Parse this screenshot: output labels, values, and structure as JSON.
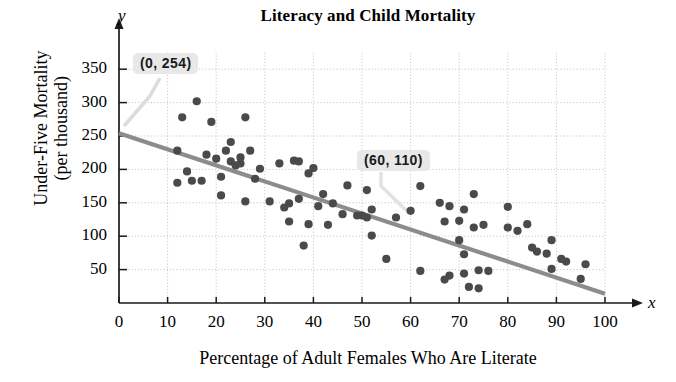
{
  "chart_data": {
    "type": "scatter",
    "title": "Literacy and Child Mortality",
    "xlabel": "Percentage of Adult Females Who Are Literate",
    "ylabel": "Under-Five Mortality (per thousand)",
    "ylabel_line1": "Under-Five Mortality",
    "ylabel_line2": "(per thousand)",
    "xlim": [
      0,
      100
    ],
    "ylim": [
      0,
      375
    ],
    "xticks": [
      0,
      10,
      20,
      30,
      40,
      50,
      60,
      70,
      80,
      90,
      100
    ],
    "yticks": [
      50,
      100,
      150,
      200,
      250,
      300,
      350
    ],
    "xtick_labels": [
      "0",
      "10",
      "20",
      "30",
      "40",
      "50",
      "60",
      "70",
      "80",
      "90",
      "100"
    ],
    "ytick_labels": [
      "50",
      "100",
      "150",
      "200",
      "250",
      "300",
      "350"
    ],
    "x_axis_variable": "x",
    "y_axis_variable": "y",
    "grid": true,
    "grid_style": "dotted",
    "legend": "none",
    "point_color": "#4a4a4a",
    "line_color": "#8c8c8c",
    "trend_line": {
      "label": "line of best fit",
      "point1": {
        "x": 0,
        "y": 254,
        "label": "(0, 254)"
      },
      "point2": {
        "x": 60,
        "y": 110,
        "label": "(60, 110)"
      },
      "slope": -2.4,
      "intercept": 254
    },
    "annotations": [
      {
        "text": "(0, 254)",
        "target_x": 0,
        "target_y": 254
      },
      {
        "text": "(60, 110)",
        "target_x": 60,
        "target_y": 110
      }
    ],
    "points": [
      {
        "x": 12,
        "y": 228
      },
      {
        "x": 12,
        "y": 180
      },
      {
        "x": 13,
        "y": 278
      },
      {
        "x": 14,
        "y": 197
      },
      {
        "x": 15,
        "y": 183
      },
      {
        "x": 16,
        "y": 302
      },
      {
        "x": 17,
        "y": 183
      },
      {
        "x": 18,
        "y": 222
      },
      {
        "x": 19,
        "y": 271
      },
      {
        "x": 20,
        "y": 216
      },
      {
        "x": 21,
        "y": 161
      },
      {
        "x": 21,
        "y": 189
      },
      {
        "x": 22,
        "y": 228
      },
      {
        "x": 23,
        "y": 241
      },
      {
        "x": 23,
        "y": 212
      },
      {
        "x": 24,
        "y": 206
      },
      {
        "x": 25,
        "y": 218
      },
      {
        "x": 25,
        "y": 209
      },
      {
        "x": 26,
        "y": 278
      },
      {
        "x": 26,
        "y": 152
      },
      {
        "x": 27,
        "y": 228
      },
      {
        "x": 28,
        "y": 186
      },
      {
        "x": 29,
        "y": 201
      },
      {
        "x": 31,
        "y": 152
      },
      {
        "x": 33,
        "y": 209
      },
      {
        "x": 34,
        "y": 143
      },
      {
        "x": 35,
        "y": 149
      },
      {
        "x": 35,
        "y": 122
      },
      {
        "x": 36,
        "y": 213
      },
      {
        "x": 37,
        "y": 212
      },
      {
        "x": 37,
        "y": 156
      },
      {
        "x": 38,
        "y": 86
      },
      {
        "x": 39,
        "y": 118
      },
      {
        "x": 39,
        "y": 194
      },
      {
        "x": 40,
        "y": 202
      },
      {
        "x": 41,
        "y": 145
      },
      {
        "x": 42,
        "y": 163
      },
      {
        "x": 43,
        "y": 117
      },
      {
        "x": 44,
        "y": 149
      },
      {
        "x": 46,
        "y": 133
      },
      {
        "x": 47,
        "y": 176
      },
      {
        "x": 49,
        "y": 131
      },
      {
        "x": 50,
        "y": 131
      },
      {
        "x": 51,
        "y": 128
      },
      {
        "x": 51,
        "y": 169
      },
      {
        "x": 52,
        "y": 140
      },
      {
        "x": 52,
        "y": 101
      },
      {
        "x": 55,
        "y": 66
      },
      {
        "x": 57,
        "y": 128
      },
      {
        "x": 60,
        "y": 138
      },
      {
        "x": 62,
        "y": 175
      },
      {
        "x": 62,
        "y": 48
      },
      {
        "x": 66,
        "y": 150
      },
      {
        "x": 67,
        "y": 122
      },
      {
        "x": 67,
        "y": 35
      },
      {
        "x": 68,
        "y": 41
      },
      {
        "x": 68,
        "y": 145
      },
      {
        "x": 70,
        "y": 123
      },
      {
        "x": 70,
        "y": 94
      },
      {
        "x": 71,
        "y": 140
      },
      {
        "x": 71,
        "y": 73
      },
      {
        "x": 71,
        "y": 44
      },
      {
        "x": 72,
        "y": 24
      },
      {
        "x": 73,
        "y": 163
      },
      {
        "x": 73,
        "y": 113
      },
      {
        "x": 74,
        "y": 49
      },
      {
        "x": 74,
        "y": 22
      },
      {
        "x": 75,
        "y": 117
      },
      {
        "x": 76,
        "y": 48
      },
      {
        "x": 80,
        "y": 144
      },
      {
        "x": 80,
        "y": 113
      },
      {
        "x": 82,
        "y": 108
      },
      {
        "x": 84,
        "y": 118
      },
      {
        "x": 85,
        "y": 83
      },
      {
        "x": 86,
        "y": 77
      },
      {
        "x": 88,
        "y": 74
      },
      {
        "x": 89,
        "y": 94
      },
      {
        "x": 89,
        "y": 51
      },
      {
        "x": 91,
        "y": 66
      },
      {
        "x": 92,
        "y": 62
      },
      {
        "x": 95,
        "y": 36
      },
      {
        "x": 96,
        "y": 58
      }
    ]
  }
}
